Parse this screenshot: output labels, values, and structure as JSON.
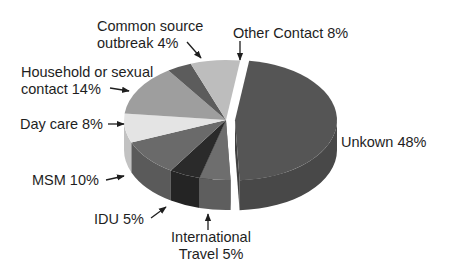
{
  "chart_data": {
    "type": "pie",
    "style": "3d-exploded",
    "title": "",
    "categories": [
      "Unkown",
      "International Travel",
      "IDU",
      "MSM",
      "Day care",
      "Household or sexual contact",
      "Common source outbreak",
      "Other Contact"
    ],
    "values": [
      48,
      5,
      5,
      10,
      8,
      14,
      4,
      8
    ],
    "unit": "%",
    "colors": [
      "#555555",
      "#6e6e6e",
      "#2a2a2a",
      "#6a6a6a",
      "#e4e4e4",
      "#9e9e9e",
      "#5c5c5c",
      "#bdbdbd"
    ],
    "exploded": [
      "Unkown"
    ],
    "legend": "none (callout labels with arrows)"
  },
  "labels": {
    "common_source": [
      "Common source",
      "outbreak 4%"
    ],
    "other_contact": [
      "Other Contact 8%"
    ],
    "household": [
      "Household or sexual",
      "contact 14%"
    ],
    "day_care": [
      "Day care 8%"
    ],
    "unknown": [
      "Unkown 48%"
    ],
    "msm": [
      "MSM 10%"
    ],
    "idu": [
      "IDU 5%"
    ],
    "intl_travel": [
      "International",
      "Travel 5%"
    ]
  }
}
